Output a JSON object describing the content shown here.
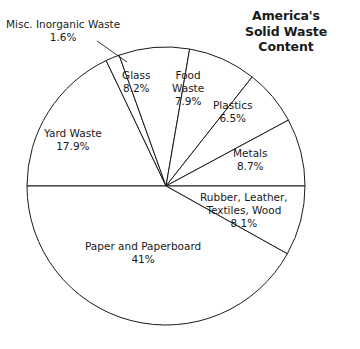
{
  "title": {
    "line1": "America's",
    "line2": "Solid Waste",
    "line3": "Content"
  },
  "chart_data": {
    "type": "pie",
    "title": "America's Solid Waste Content",
    "unit": "percent",
    "legend": "none",
    "labels_position": "inside-and-callout",
    "categories": [
      "Yard Waste",
      "Misc. Inorganic Waste",
      "Glass",
      "Food Waste",
      "Plastics",
      "Metals",
      "Rubber, Leather, Textiles, Wood",
      "Paper and Paperboard"
    ],
    "values": [
      17.9,
      1.6,
      8.2,
      7.9,
      6.5,
      8.7,
      8.1,
      41
    ],
    "value_labels": [
      "17.9%",
      "1.6%",
      "8.2%",
      "7.9%",
      "6.5%",
      "8.7%",
      "8.1%",
      "41%"
    ],
    "total": 99.9,
    "slices": [
      {
        "name": "Yard Waste",
        "name_lines": [
          "Yard Waste"
        ],
        "value": 17.9,
        "value_label": "17.9%",
        "start_angle_deg": 180,
        "sweep_deg": 64.5,
        "callout": false
      },
      {
        "name": "Misc. Inorganic Waste",
        "name_lines": [
          "Misc. Inorganic Waste"
        ],
        "value": 1.6,
        "value_label": "1.6%",
        "start_angle_deg": 244.5,
        "sweep_deg": 5.8,
        "callout": true
      },
      {
        "name": "Glass",
        "name_lines": [
          "Glass"
        ],
        "value": 8.2,
        "value_label": "8.2%",
        "start_angle_deg": 250.3,
        "sweep_deg": 29.5,
        "callout": false
      },
      {
        "name": "Food Waste",
        "name_lines": [
          "Food",
          "Waste"
        ],
        "value": 7.9,
        "value_label": "7.9%",
        "start_angle_deg": 279.8,
        "sweep_deg": 28.5,
        "callout": false
      },
      {
        "name": "Plastics",
        "name_lines": [
          "Plastics"
        ],
        "value": 6.5,
        "value_label": "6.5%",
        "start_angle_deg": 308.3,
        "sweep_deg": 23.4,
        "callout": false
      },
      {
        "name": "Metals",
        "name_lines": [
          "Metals"
        ],
        "value": 8.7,
        "value_label": "8.7%",
        "start_angle_deg": 331.7,
        "sweep_deg": 28.3,
        "callout": false
      },
      {
        "name": "Rubber, Leather, Textiles, Wood",
        "name_lines": [
          "Rubber, Leather,",
          "Textiles, Wood"
        ],
        "value": 8.1,
        "value_label": "8.1%",
        "start_angle_deg": 0,
        "sweep_deg": 29.2,
        "callout": false
      },
      {
        "name": "Paper and Paperboard",
        "name_lines": [
          "Paper and Paperboard"
        ],
        "value": 41,
        "value_label": "41%",
        "start_angle_deg": 29.2,
        "sweep_deg": 150.8,
        "callout": false
      }
    ],
    "style": {
      "fill": "#ffffff",
      "stroke": "#1a1a1a",
      "stroke_width": 1,
      "center_x": 166,
      "center_y": 186,
      "radius": 139
    }
  },
  "labels": {
    "misc": {
      "name": "Misc. Inorganic Waste",
      "pct": "1.6%"
    },
    "yard": {
      "name": "Yard Waste",
      "pct": "17.9%"
    },
    "glass": {
      "name": "Glass",
      "pct": "8.2%"
    },
    "food1": {
      "name": "Food"
    },
    "food2": {
      "name": "Waste",
      "pct": "7.9%"
    },
    "plastics": {
      "name": "Plastics",
      "pct": "6.5%"
    },
    "metals": {
      "name": "Metals",
      "pct": "8.7%"
    },
    "rubber1": {
      "name": "Rubber, Leather,"
    },
    "rubber2": {
      "name": "Textiles, Wood",
      "pct": "8.1%"
    },
    "paper": {
      "name": "Paper and Paperboard",
      "pct": "41%"
    }
  }
}
